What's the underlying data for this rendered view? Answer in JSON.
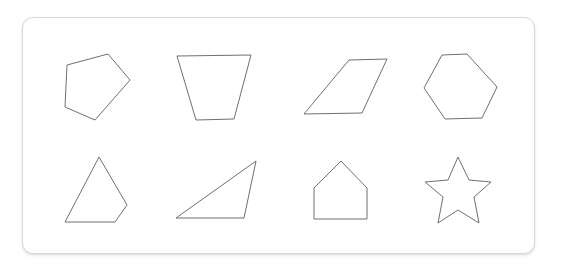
{
  "canvas": {
    "width": 561,
    "height": 276,
    "background_color": "#ffffff"
  },
  "card": {
    "name": "shape-card",
    "x": 22,
    "y": 17,
    "width": 513,
    "height": 237,
    "corner_radius": 11,
    "border_color": "#d8d8d8",
    "fill_color": "#ffffff",
    "has_drop_shadow": true
  },
  "style": {
    "stroke_color": "#6f6f6f",
    "stroke_width": 1,
    "fill": "none"
  },
  "shape_data": {
    "type": "polygon-diagram",
    "title": "",
    "rows": 2,
    "columns": 4,
    "count": 8,
    "shapes": [
      {
        "index": 1,
        "name": "pentagon-irregular",
        "label": "pentagon",
        "row": 1,
        "column": 1,
        "sides": 5,
        "points": "108,54 130,80 95,120 65,107 67,65"
      },
      {
        "index": 2,
        "name": "trapezoid",
        "label": "trapezoid",
        "row": 1,
        "column": 2,
        "sides": 4,
        "points": "177,56 251,55 234,119 196,120"
      },
      {
        "index": 3,
        "name": "parallelogram",
        "label": "parallelogram",
        "row": 1,
        "column": 3,
        "sides": 4,
        "points": "349,60 387,59 362,113 304,114"
      },
      {
        "index": 4,
        "name": "hexagon",
        "label": "hexagon",
        "row": 1,
        "column": 4,
        "sides": 6,
        "points": "442,55 467,54 497,87 482,118 445,119 424,88"
      },
      {
        "index": 5,
        "name": "triangle-with-clipped-corner",
        "label": "quadrilateral",
        "row": 2,
        "column": 1,
        "sides": 4,
        "points": "99,157 127,205 115,222 65,222"
      },
      {
        "index": 6,
        "name": "right-triangle",
        "label": "triangle",
        "row": 2,
        "column": 2,
        "sides": 3,
        "points": "256,161 244,218 176,218"
      },
      {
        "index": 7,
        "name": "house-pentagon",
        "label": "pentagon",
        "row": 2,
        "column": 3,
        "sides": 5,
        "points": "341,161 367,188 367,219 314,219 314,188"
      },
      {
        "index": 8,
        "name": "five-pointed-star",
        "label": "star",
        "row": 2,
        "column": 4,
        "sides": 10,
        "points": "458,157 469,180 491,182 474,197 479,223 458,210 438,223 443,197 425,182 448,180"
      }
    ]
  }
}
